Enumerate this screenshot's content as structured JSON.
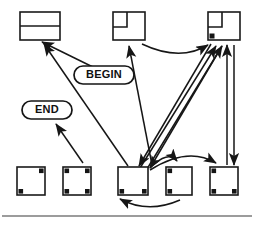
{
  "figure": {
    "name": "state-transition-diagram",
    "background_color": "#ffffff",
    "line_color": "#161616",
    "width": 254,
    "height": 227
  },
  "labels": {
    "begin": {
      "text": "BEGIN",
      "shape": "rounded-pill",
      "x": 104,
      "y": 75,
      "w": 60,
      "h": 18
    },
    "end": {
      "text": "END",
      "shape": "rounded-pill",
      "x": 47,
      "y": 110,
      "w": 50,
      "h": 18
    }
  },
  "nodes": [
    {
      "id": "top-left-node",
      "name": "node-split-horizontal",
      "row": "top",
      "x": 20,
      "y": 12,
      "w": 40,
      "h": 28,
      "style": "rect-with-horizontal-divider",
      "corner_marks": []
    },
    {
      "id": "top-middle-node",
      "name": "node-inset-square",
      "row": "top",
      "x": 113,
      "y": 12,
      "w": 32,
      "h": 28,
      "style": "square-with-inset-corner",
      "corner_marks": []
    },
    {
      "id": "top-right-node",
      "name": "node-inset-square-marked",
      "row": "top",
      "x": 208,
      "y": 12,
      "w": 32,
      "h": 28,
      "style": "square-with-inset-corner",
      "corner_marks": [
        "bottom-left"
      ]
    },
    {
      "id": "bottom-node-1",
      "name": "node-bottom-1",
      "row": "bottom",
      "x": 17,
      "y": 167,
      "w": 28,
      "h": 28,
      "style": "plain-square",
      "corner_marks": [
        "top-right",
        "bottom-left"
      ]
    },
    {
      "id": "bottom-node-2",
      "name": "node-bottom-2",
      "row": "bottom",
      "x": 63,
      "y": 167,
      "w": 28,
      "h": 28,
      "style": "plain-square",
      "corner_marks": [
        "top-left",
        "top-right",
        "bottom-left",
        "bottom-right"
      ]
    },
    {
      "id": "bottom-node-3",
      "name": "node-bottom-3",
      "row": "bottom",
      "x": 118,
      "y": 167,
      "w": 30,
      "h": 28,
      "style": "plain-square",
      "corner_marks": [
        "bottom-left",
        "bottom-right"
      ]
    },
    {
      "id": "bottom-node-4",
      "name": "node-bottom-4",
      "row": "bottom",
      "x": 166,
      "y": 167,
      "w": 26,
      "h": 28,
      "style": "plain-square",
      "corner_marks": [
        "top-left",
        "bottom-left"
      ]
    },
    {
      "id": "bottom-node-5",
      "name": "node-bottom-5",
      "row": "bottom",
      "x": 210,
      "y": 167,
      "w": 28,
      "h": 28,
      "style": "plain-square",
      "corner_marks": [
        "top-left",
        "bottom-left",
        "bottom-right"
      ]
    }
  ],
  "edges": [
    {
      "name": "edge-node3-to-topleft",
      "from": "bottom-node-3",
      "to": "top-left-node",
      "type": "straight",
      "arrow": "to"
    },
    {
      "name": "edge-begin-to-topleft",
      "from": "begin-label",
      "to": "top-left-node",
      "type": "straight",
      "arrow": "to"
    },
    {
      "name": "edge-node2-to-end",
      "from": "bottom-node-2",
      "to": "end-label",
      "type": "straight",
      "arrow": "to"
    },
    {
      "name": "edge-topmiddle-to-topright",
      "from": "top-middle-node",
      "to": "top-right-node",
      "type": "curved",
      "arrow": "to"
    },
    {
      "name": "edge-node3-to-topmiddle",
      "from": "bottom-node-3",
      "to": "top-middle-node",
      "type": "straight",
      "arrow": "to"
    },
    {
      "name": "edge-topmiddle-to-node3",
      "from": "top-middle-node",
      "to": "bottom-node-3",
      "type": "straight",
      "arrow": "to"
    },
    {
      "name": "edge-node3-to-topright-a",
      "from": "bottom-node-3",
      "to": "top-right-node",
      "type": "straight",
      "arrow": "to"
    },
    {
      "name": "edge-node3-to-topright-b",
      "from": "bottom-node-3",
      "to": "top-right-node",
      "type": "straight",
      "arrow": "to"
    },
    {
      "name": "edge-topright-to-node3",
      "from": "top-right-node",
      "to": "bottom-node-3",
      "type": "straight",
      "arrow": "to"
    },
    {
      "name": "edge-node5-to-topright",
      "from": "bottom-node-5",
      "to": "top-right-node",
      "type": "straight",
      "arrow": "to"
    },
    {
      "name": "edge-topright-to-node5",
      "from": "top-right-node",
      "to": "bottom-node-5",
      "type": "straight",
      "arrow": "to"
    },
    {
      "name": "edge-node3-to-node4",
      "from": "bottom-node-3",
      "to": "bottom-node-4",
      "type": "curved",
      "arrow": "to"
    },
    {
      "name": "edge-node3-to-node5",
      "from": "bottom-node-3",
      "to": "bottom-node-5",
      "type": "curved",
      "arrow": "to"
    },
    {
      "name": "edge-node4-to-node3",
      "from": "bottom-node-4",
      "to": "bottom-node-3",
      "type": "curved-below",
      "arrow": "to"
    }
  ],
  "footer_rule": {
    "name": "horizontal-rule",
    "y": 216,
    "x1": 2,
    "x2": 252
  }
}
